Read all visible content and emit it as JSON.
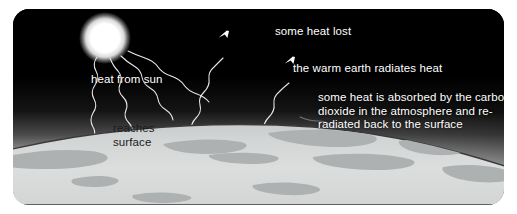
{
  "diagram": {
    "panel": {
      "background_color": "#000000",
      "corner_radius": "16px"
    },
    "sun": {
      "name": "sun",
      "color": "#ffffff",
      "center_x": 92,
      "center_y": 29,
      "radius": 19
    },
    "earth": {
      "surface_color": "#d6d8d8",
      "land_color": "#a9acac",
      "outline_color": "#3a3a3a"
    },
    "atmosphere": {
      "top_color": "#000000",
      "glow_color": "#ffffff"
    },
    "labels": {
      "heat_from_sun": "heat from sun",
      "reaches_surface_line1": "reaches",
      "reaches_surface_line2": "surface",
      "some_heat_lost": "some heat lost",
      "warm_earth_radiates": "the warm earth radiates heat",
      "absorbed_line1": "some heat is absorbed by the carbon",
      "absorbed_line2": "dioxide in the atmosphere and re-",
      "absorbed_line3": "radiated back to the surface"
    },
    "arrows": {
      "incoming": [
        {
          "name": "sun-ray-1",
          "direction": "down",
          "style": "wavy"
        },
        {
          "name": "sun-ray-2",
          "direction": "down",
          "style": "wavy"
        },
        {
          "name": "sun-ray-3",
          "direction": "down",
          "style": "wavy"
        },
        {
          "name": "sun-ray-4",
          "direction": "down",
          "style": "wavy"
        }
      ],
      "outgoing": [
        {
          "name": "heat-lost-ray",
          "direction": "up",
          "style": "wavy"
        },
        {
          "name": "earth-radiates-ray",
          "direction": "up",
          "style": "wavy"
        }
      ],
      "reradiated": [
        {
          "name": "reradiated-ray",
          "direction": "down",
          "style": "wavy"
        }
      ],
      "stroke_color": "#ffffff",
      "stroke_color_dark": "#555555"
    }
  }
}
